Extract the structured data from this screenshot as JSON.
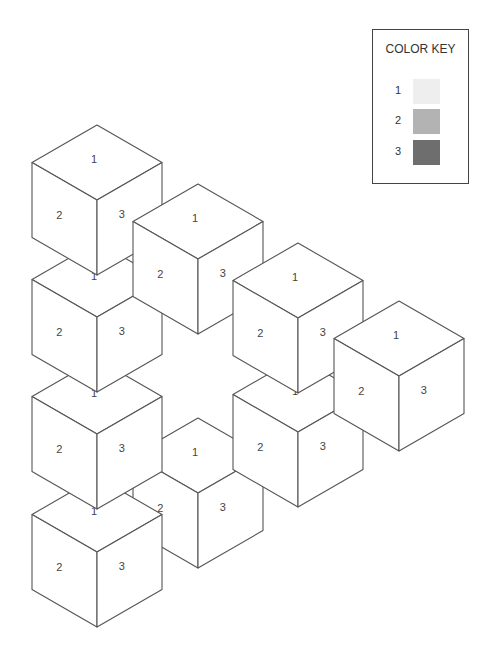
{
  "color_key": {
    "title": "COLOR KEY",
    "entries": [
      {
        "number": "1",
        "color": "#eeeeee"
      },
      {
        "number": "2",
        "color": "#b3b3b3"
      },
      {
        "number": "3",
        "color": "#6e6e6e"
      }
    ]
  },
  "cubes": {
    "draw_order_note": "back to front",
    "geometry": {
      "half_width": 65,
      "diag": 37.5,
      "height": 75
    },
    "items": [
      {
        "id": "H",
        "top_x": 198,
        "top_y": 418,
        "labels": {
          "top": "1",
          "left": "2",
          "right": "3"
        }
      },
      {
        "id": "G",
        "top_x": 97,
        "top_y": 477,
        "labels": {
          "top": "1",
          "left": "2",
          "right": "3"
        }
      },
      {
        "id": "F",
        "top_x": 97,
        "top_y": 359,
        "labels": {
          "top": "1",
          "left": "2",
          "right": "3"
        }
      },
      {
        "id": "E",
        "top_x": 97,
        "top_y": 242,
        "labels": {
          "top": "1",
          "left": "2",
          "right": "3"
        }
      },
      {
        "id": "A",
        "top_x": 97,
        "top_y": 125,
        "labels": {
          "top": "1",
          "left": "2",
          "right": "3"
        }
      },
      {
        "id": "B",
        "top_x": 198,
        "top_y": 184,
        "labels": {
          "top": "1",
          "left": "2",
          "right": "3"
        }
      },
      {
        "id": "I",
        "top_x": 298,
        "top_y": 357,
        "labels": {
          "top": "1",
          "left": "2",
          "right": "3"
        }
      },
      {
        "id": "C",
        "top_x": 298,
        "top_y": 243,
        "labels": {
          "top": "1",
          "left": "2",
          "right": "3"
        }
      },
      {
        "id": "D",
        "top_x": 399,
        "top_y": 301,
        "labels": {
          "top": "1",
          "left": "2",
          "right": "3"
        }
      }
    ]
  }
}
